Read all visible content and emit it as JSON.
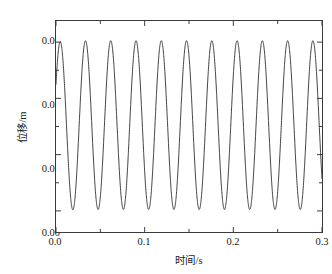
{
  "chart_data": {
    "type": "line",
    "title": "",
    "subtitle": "",
    "xlabel": "时间/s",
    "ylabel": "位移/m",
    "xlim": [
      0.0,
      0.3
    ],
    "ylim": [
      -0.0075,
      0.0675
    ],
    "grid": false,
    "legend": null,
    "legend_position": "none",
    "line_color": "#2b2b2b",
    "line_width": 0.9,
    "background_color": "#ffffff",
    "frame_color": "#3b3b3b",
    "x_major_ticks": [
      0.0,
      0.1,
      0.2,
      0.3
    ],
    "x_major_tick_labels": [
      "0.0",
      "0.1",
      "0.2",
      "0.3"
    ],
    "x_minor_ticks": [
      0.05,
      0.15,
      0.25
    ],
    "y_major_ticks": [
      0.0,
      0.02,
      0.04,
      0.06
    ],
    "y_major_tick_labels": [
      "0.00",
      "0.02",
      "0.04",
      "0.06"
    ],
    "y_minor_ticks": [
      0.01,
      0.03,
      0.05
    ],
    "tick_direction": "in",
    "annotations": [],
    "series": [
      {
        "name": "displacement",
        "initial_value": 0.045,
        "peak_value": 0.0605,
        "first_peak_value": 0.059,
        "trough_value": 0.0005,
        "first_trough_value": 0.003,
        "first_trough_time": 0.019,
        "period": 0.0285,
        "peak_count": 10,
        "peak_times": [
          0.0305,
          0.059,
          0.0875,
          0.116,
          0.1445,
          0.173,
          0.2015,
          0.23,
          0.2585,
          0.287
        ],
        "trough_times": [
          0.019,
          0.0445,
          0.073,
          0.1015,
          0.13,
          0.1585,
          0.187,
          0.2155,
          0.244,
          0.2725,
          0.3
        ]
      }
    ]
  }
}
